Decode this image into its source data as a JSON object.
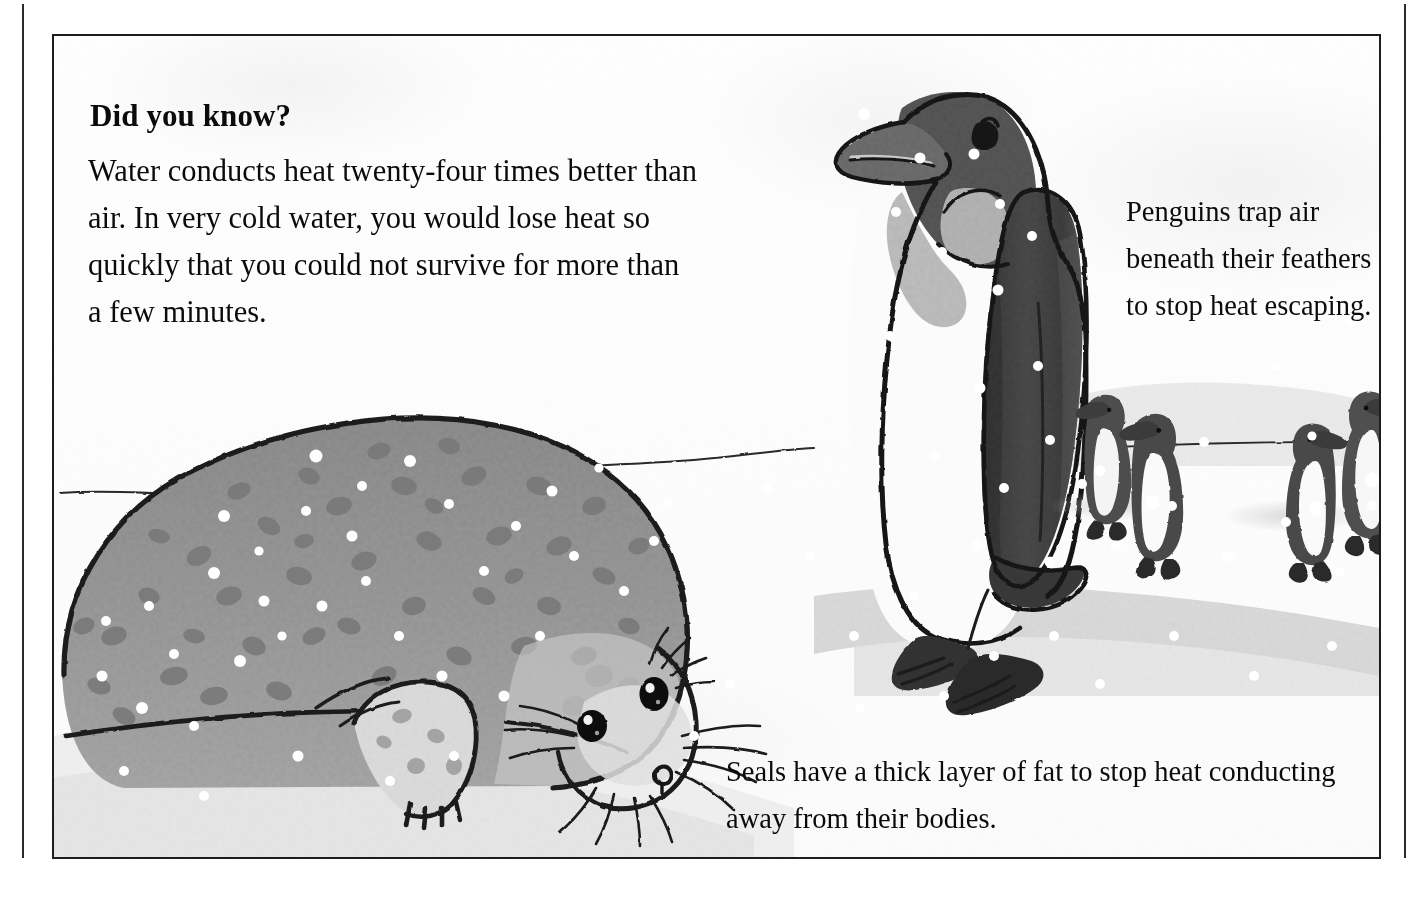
{
  "page": {
    "kind": "illustrated-book-page",
    "background_color": "#ffffff",
    "frame_color": "#1d1d1d"
  },
  "callout": {
    "heading": "Did you know?",
    "body": "Water conducts heat twenty-four times better than air. In very cold water, you would lose heat so quickly that you could not survive for more than a few minutes."
  },
  "captions": {
    "penguin": "Penguins trap air beneath their feathers to stop heat escaping.",
    "seal": "Seals have a thick layer of fat to stop heat conducting away from their bodies."
  },
  "illustration": {
    "scene": "antarctic-snow-scene",
    "subjects": [
      "harbour-seal-lying-on-snow",
      "emperor-penguin-standing",
      "four-small-background-penguins",
      "falling-snowflakes",
      "horizon-line"
    ],
    "palette": {
      "ink": "#1d1d1d",
      "seal_body": "#9a9a9a",
      "seal_spots": "#7c7c7c",
      "seal_belly": "#d8d8d8",
      "penguin_dark": "#4a4a4a",
      "penguin_back": "#3d3d3d",
      "penguin_white": "#fbfbfb",
      "snow_shadow": "#c9c9c9",
      "snow": "#f2f2f2"
    }
  }
}
